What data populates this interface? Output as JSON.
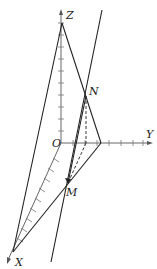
{
  "diagram": {
    "type": "3d-coordinate-geometry",
    "labels": {
      "origin": "O",
      "x_axis": "X",
      "y_axis": "Y",
      "z_axis": "Z",
      "point_n": "N",
      "point_m": "M"
    },
    "points": {
      "O": [
        61,
        143
      ],
      "Z": [
        62,
        23
      ],
      "X": [
        13,
        252
      ],
      "N": [
        86,
        96
      ],
      "M": [
        68,
        183
      ],
      "Yp": [
        101,
        143
      ]
    },
    "colors": {
      "line": "#222222",
      "axis": "#555555",
      "background": "#ffffff"
    }
  }
}
